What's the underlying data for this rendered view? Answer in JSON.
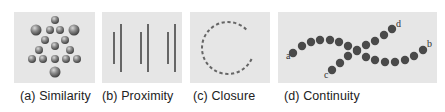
{
  "figure": {
    "panels": [
      {
        "id": "similarity",
        "caption": "(a) Similarity",
        "x": 14,
        "width": 81,
        "circles": [
          {
            "cx": 41,
            "cy": 8,
            "r": 4,
            "size": "small"
          },
          {
            "cx": 22,
            "cy": 18,
            "r": 5.5,
            "size": "large"
          },
          {
            "cx": 36,
            "cy": 18,
            "r": 4,
            "size": "small"
          },
          {
            "cx": 46,
            "cy": 18,
            "r": 4,
            "size": "small"
          },
          {
            "cx": 60,
            "cy": 18,
            "r": 5.5,
            "size": "large"
          },
          {
            "cx": 31,
            "cy": 28,
            "r": 4,
            "size": "small"
          },
          {
            "cx": 51,
            "cy": 28,
            "r": 4,
            "size": "small"
          },
          {
            "cx": 41,
            "cy": 34,
            "r": 4,
            "size": "small"
          },
          {
            "cx": 25,
            "cy": 38,
            "r": 4,
            "size": "small"
          },
          {
            "cx": 56,
            "cy": 38,
            "r": 4,
            "size": "small"
          },
          {
            "cx": 18,
            "cy": 47,
            "r": 4,
            "size": "small"
          },
          {
            "cx": 29,
            "cy": 47,
            "r": 4,
            "size": "small"
          },
          {
            "cx": 41,
            "cy": 47,
            "r": 4,
            "size": "small"
          },
          {
            "cx": 52,
            "cy": 47,
            "r": 4,
            "size": "small"
          },
          {
            "cx": 63,
            "cy": 47,
            "r": 4,
            "size": "small"
          },
          {
            "cx": 41,
            "cy": 60,
            "r": 5.5,
            "size": "large"
          }
        ]
      },
      {
        "id": "proximity",
        "caption": "(b) Proximity",
        "x": 102,
        "width": 80,
        "lines": [
          {
            "x": 12,
            "y1": 20,
            "y2": 52
          },
          {
            "x": 19,
            "y1": 12,
            "y2": 60
          },
          {
            "x": 39,
            "y1": 20,
            "y2": 52
          },
          {
            "x": 46,
            "y1": 12,
            "y2": 60
          },
          {
            "x": 66,
            "y1": 20,
            "y2": 52
          },
          {
            "x": 73,
            "y1": 12,
            "y2": 60
          }
        ]
      },
      {
        "id": "closure",
        "caption": "(c) Closure",
        "x": 190,
        "width": 80,
        "arc": {
          "cx": 38,
          "cy": 36,
          "r": 26,
          "gap_start_deg": -40,
          "gap_end_deg": 25
        }
      },
      {
        "id": "continuity",
        "caption": "(d) Continuity",
        "x": 278,
        "width": 159,
        "labels": [
          {
            "text": "a",
            "x": 8,
            "y": 47
          },
          {
            "text": "b",
            "x": 149,
            "y": 35
          },
          {
            "text": "c",
            "x": 46,
            "y": 66
          },
          {
            "text": "d",
            "x": 118,
            "y": 15
          }
        ],
        "curve_ab": [
          [
            15,
            41
          ],
          [
            24,
            34
          ],
          [
            33,
            30
          ],
          [
            42,
            28
          ],
          [
            52,
            28
          ],
          [
            61,
            30
          ],
          [
            70,
            34
          ],
          [
            79,
            39
          ],
          [
            88,
            45
          ],
          [
            97,
            48
          ],
          [
            107,
            50
          ],
          [
            117,
            50
          ],
          [
            127,
            48
          ],
          [
            136,
            44
          ],
          [
            145,
            38
          ]
        ],
        "curve_cd": [
          [
            54,
            58
          ],
          [
            62,
            51
          ],
          [
            70,
            44
          ],
          [
            79,
            38
          ],
          [
            88,
            33
          ],
          [
            97,
            29
          ],
          [
            106,
            23
          ],
          [
            114,
            17
          ]
        ]
      }
    ]
  },
  "colors": {
    "panel_bg": "#e6e6e6",
    "sphere": "#7a7a7a",
    "line": "#666666",
    "dot": "#4a4a4a",
    "caption": "#222222"
  }
}
